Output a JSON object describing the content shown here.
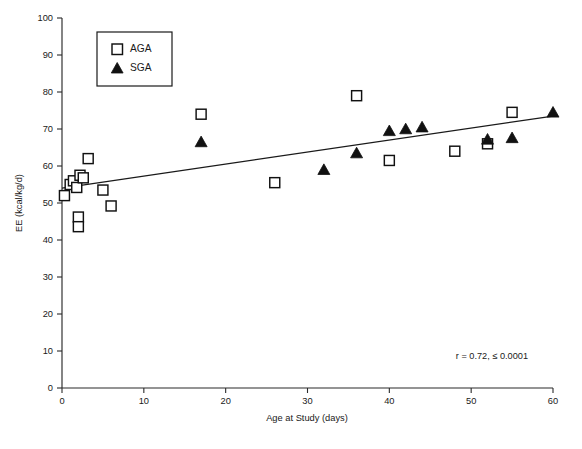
{
  "chart_data": {
    "type": "scatter",
    "title": "",
    "xlabel": "Age at Study (days)",
    "ylabel": "EE (kcal/kg/d)",
    "xlim": [
      0,
      60
    ],
    "ylim": [
      0,
      100
    ],
    "xticks": [
      0,
      10,
      20,
      30,
      40,
      50,
      60
    ],
    "yticks": [
      0,
      10,
      20,
      30,
      40,
      50,
      60,
      70,
      80,
      90,
      100
    ],
    "grid": false,
    "legend_position": "upper-left-inset",
    "annotation": "r = 0.72, ≤ 0.0001",
    "series": [
      {
        "name": "AGA",
        "marker": "open-square",
        "points": [
          [
            0.3,
            52.0
          ],
          [
            1.0,
            55.0
          ],
          [
            1.4,
            56.0
          ],
          [
            1.8,
            54.2
          ],
          [
            2.2,
            57.5
          ],
          [
            2.6,
            56.8
          ],
          [
            2.0,
            46.2
          ],
          [
            2.0,
            43.6
          ],
          [
            3.2,
            62.0
          ],
          [
            5.0,
            53.5
          ],
          [
            6.0,
            49.2
          ],
          [
            17.0,
            74.0
          ],
          [
            26.0,
            55.5
          ],
          [
            36.0,
            79.0
          ],
          [
            40.0,
            61.5
          ],
          [
            48.0,
            64.0
          ],
          [
            52.0,
            66.0
          ],
          [
            55.0,
            74.5
          ]
        ]
      },
      {
        "name": "SGA",
        "marker": "filled-triangle",
        "points": [
          [
            17.0,
            66.5
          ],
          [
            32.0,
            59.0
          ],
          [
            36.0,
            63.5
          ],
          [
            40.0,
            69.5
          ],
          [
            42.0,
            70.0
          ],
          [
            44.0,
            70.5
          ],
          [
            52.0,
            67.2
          ],
          [
            55.0,
            67.6
          ],
          [
            60.0,
            74.5
          ]
        ]
      }
    ],
    "fit_line": {
      "name": "regression-line",
      "x": [
        0,
        60
      ],
      "y": [
        54.0,
        73.5
      ]
    }
  },
  "legend": {
    "entries": [
      {
        "label": "AGA",
        "marker": "open-square"
      },
      {
        "label": "SGA",
        "marker": "filled-triangle"
      }
    ]
  },
  "axes": {
    "x_title": "Age at Study (days)",
    "y_title": "EE (kcal/kg/d)",
    "x_tick_labels": [
      "0",
      "10",
      "20",
      "30",
      "40",
      "50",
      "60"
    ],
    "y_tick_labels": [
      "0",
      "10",
      "20",
      "30",
      "40",
      "50",
      "60",
      "70",
      "80",
      "90",
      "100"
    ]
  },
  "annotation": {
    "stats_text": "r = 0.72, ≤ 0.0001"
  },
  "colors": {
    "marker_stroke": "#111111",
    "marker_fill_open": "#ffffff",
    "marker_fill_solid": "#111111",
    "axis": "#2b2b2b",
    "text": "#1a1a1a",
    "background": "#ffffff"
  }
}
